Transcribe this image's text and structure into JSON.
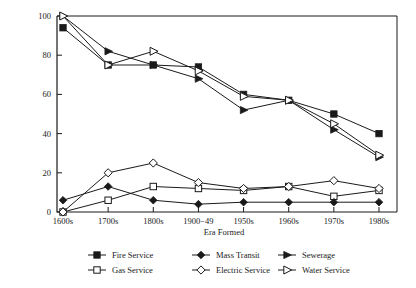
{
  "chart_data": {
    "type": "line",
    "title": "",
    "xlabel": "Era Formed",
    "ylabel": "",
    "categories": [
      "1600s",
      "1700s",
      "1800s",
      "1900−49",
      "1950s",
      "1960s",
      "1970s",
      "1980s"
    ],
    "ylim": [
      0,
      100
    ],
    "yticks": [
      0,
      20,
      40,
      60,
      80,
      100
    ],
    "grid": false,
    "legend_position": "bottom",
    "series": [
      {
        "name": "Fire Service",
        "marker": "filled-square",
        "values": [
          94,
          75,
          75,
          74,
          60,
          57,
          50,
          40
        ]
      },
      {
        "name": "Gas Service",
        "marker": "open-square",
        "values": [
          0,
          6,
          13,
          12,
          11,
          13,
          8,
          11
        ]
      },
      {
        "name": "Mass Transit",
        "marker": "filled-diamond",
        "values": [
          6,
          13,
          6,
          4,
          5,
          5,
          5,
          5
        ]
      },
      {
        "name": "Electric Service",
        "marker": "open-diamond",
        "values": [
          0,
          20,
          25,
          15,
          12,
          13,
          16,
          12
        ]
      },
      {
        "name": "Sewerage",
        "marker": "filled-triangle",
        "values": [
          100,
          82,
          75,
          68,
          52,
          57,
          42,
          28
        ]
      },
      {
        "name": "Water Service",
        "marker": "open-triangle",
        "values": [
          100,
          75,
          82,
          72,
          59,
          57,
          45,
          29
        ]
      }
    ]
  },
  "legend": {
    "entries": [
      {
        "label": "Fire Service",
        "marker": "filled-square"
      },
      {
        "label": "Mass Transit",
        "marker": "filled-diamond"
      },
      {
        "label": "Sewerage",
        "marker": "filled-triangle"
      },
      {
        "label": "Gas Service",
        "marker": "open-square"
      },
      {
        "label": "Electric Service",
        "marker": "open-diamond"
      },
      {
        "label": "Water Service",
        "marker": "open-triangle"
      }
    ]
  },
  "colors": {
    "ink": "#1a1a1a",
    "background": "#ffffff"
  }
}
